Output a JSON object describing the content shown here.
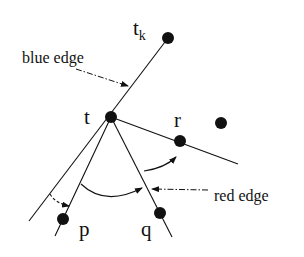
{
  "diagram": {
    "labels": {
      "t_k_base": "t",
      "t_k_sub": "k",
      "t": "t",
      "r": "r",
      "p": "p",
      "q": "q",
      "blue_edge": "blue edge",
      "red_edge": "red edge"
    },
    "colors": {
      "ink": "#111111",
      "background": "#ffffff"
    }
  }
}
